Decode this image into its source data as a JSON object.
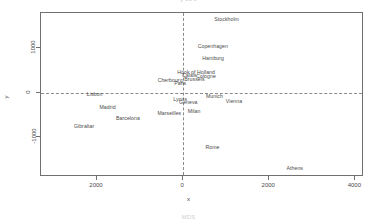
{
  "figure": {
    "top_title": "y vs x",
    "bottom_caption": "MDS"
  },
  "chart_data": {
    "type": "scatter",
    "title": "y vs x",
    "xlabel": "x",
    "ylabel": "y",
    "xlim": [
      -3300,
      4200
    ],
    "ylim": [
      -1900,
      1800
    ],
    "grid": false,
    "legend": null,
    "reference_lines": [
      {
        "axis": "x",
        "value": 0,
        "style": "dashed"
      },
      {
        "axis": "y",
        "value": 0,
        "style": "dashed"
      }
    ],
    "xticks": [
      -2000,
      0,
      2000,
      4000
    ],
    "xticklabels": [
      "2000",
      "0",
      "2000",
      "4000"
    ],
    "yticks": [
      1000,
      0,
      -1000
    ],
    "yticklabels": [
      "1000",
      "0",
      "-1000"
    ],
    "marker": "text-label",
    "points": [
      {
        "label": "Athens",
        "x": 2593,
        "y": -1705
      },
      {
        "label": "Barcelona",
        "x": -1281,
        "y": -568
      },
      {
        "label": "Brussels",
        "x": 263,
        "y": 318
      },
      {
        "label": "Calais",
        "x": 146,
        "y": 391
      },
      {
        "label": "Cherbourg",
        "x": -302,
        "y": 282
      },
      {
        "label": "Cologne",
        "x": 532,
        "y": 380
      },
      {
        "label": "Copenhagen",
        "x": 689,
        "y": 1046
      },
      {
        "label": "Geneva",
        "x": 121,
        "y": -212
      },
      {
        "label": "Gibraltar",
        "x": -2300,
        "y": -748
      },
      {
        "label": "Hamburg",
        "x": 697,
        "y": 775
      },
      {
        "label": "Hook of Holland",
        "x": 302,
        "y": 469
      },
      {
        "label": "Lisbon",
        "x": -2055,
        "y": -35
      },
      {
        "label": "Lyons",
        "x": -70,
        "y": -146
      },
      {
        "label": "Madrid",
        "x": -1754,
        "y": -312
      },
      {
        "label": "Marseilles",
        "x": -320,
        "y": -457
      },
      {
        "label": "Milan",
        "x": 255,
        "y": -412
      },
      {
        "label": "Munich",
        "x": 727,
        "y": -76
      },
      {
        "label": "Paris",
        "x": -67,
        "y": 232
      },
      {
        "label": "Rome",
        "x": 682,
        "y": -1232
      },
      {
        "label": "Stockholm",
        "x": 1011,
        "y": 1660
      },
      {
        "label": "Vienna",
        "x": 1181,
        "y": -196
      }
    ]
  }
}
